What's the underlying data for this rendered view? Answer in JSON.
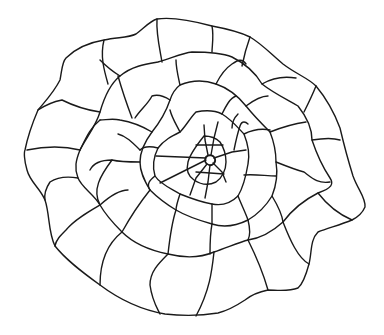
{
  "figure": {
    "description": "Line drawing of a spiral arrangement of irregular polygonal cells radiating from a small central point",
    "line_color": "#1a1a1a",
    "background": "#ffffff",
    "stroke_width": 1.4
  }
}
